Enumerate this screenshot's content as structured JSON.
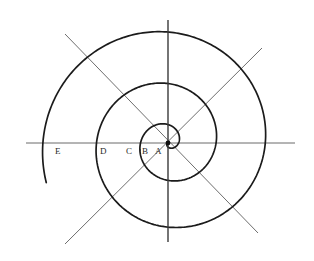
{
  "figure": {
    "background_color": "#ffffff",
    "width": 314,
    "height": 261,
    "center": {
      "x": 168,
      "y": 143
    },
    "center_dot_radius": 2.4,
    "colors": {
      "spiral": "#1b1b1b",
      "axis": "#6b6b6b",
      "vertical_axis": "#3a3a3a",
      "diagonal": "#6e6e6e",
      "label": "#2a2a2a",
      "center_dot": "#111111"
    }
  },
  "axes": {
    "horizontal": {
      "x1": 26,
      "y1": 143,
      "x2": 295,
      "y2": 143
    },
    "vertical": {
      "x1": 168,
      "y1": 20,
      "x2": 168,
      "y2": 242
    },
    "diagonal_nw_se": {
      "x1": 65,
      "y1": 34,
      "x2": 258,
      "y2": 233
    },
    "diagonal_ne_sw": {
      "x1": 262,
      "y1": 48,
      "x2": 65,
      "y2": 244
    }
  },
  "labels": [
    {
      "id": "label-e",
      "text": "E",
      "x": 55,
      "y": 154
    },
    {
      "id": "label-d",
      "text": "D",
      "x": 100,
      "y": 154
    },
    {
      "id": "label-c",
      "text": "C",
      "x": 126,
      "y": 154
    },
    {
      "id": "label-b",
      "text": "B",
      "x": 142,
      "y": 154
    },
    {
      "id": "label-a",
      "text": "A",
      "x": 155,
      "y": 154
    }
  ],
  "chart_data": {
    "type": "line",
    "xlabel": "",
    "ylabel": "",
    "curve": "archimedean-spiral",
    "spiral_equation": "r = a * theta",
    "spiral_turns": 3.05,
    "spiral_start_angle_deg": 0,
    "spiral_end_angle_deg": 1098,
    "spiral_direction": "counterclockwise-outward",
    "spiral_max_radius_px": 128,
    "spiral_end_point": {
      "x": 196,
      "y": 20
    },
    "left_axis_crossings": [
      {
        "label": "A",
        "x": 161,
        "radius_px": 7
      },
      {
        "label": "B",
        "x": 150,
        "radius_px": 18
      },
      {
        "label": "C",
        "x": 134,
        "radius_px": 34
      },
      {
        "label": "D",
        "x": 107,
        "radius_px": 61
      },
      {
        "label": "E",
        "x": 58,
        "radius_px": 110
      }
    ],
    "right_axis_crossings": [
      {
        "x": 182,
        "radius_px": 14
      },
      {
        "x": 199,
        "radius_px": 31
      },
      {
        "x": 224,
        "radius_px": 56
      },
      {
        "x": 256,
        "radius_px": 88
      }
    ],
    "legend": [],
    "grid": false
  }
}
